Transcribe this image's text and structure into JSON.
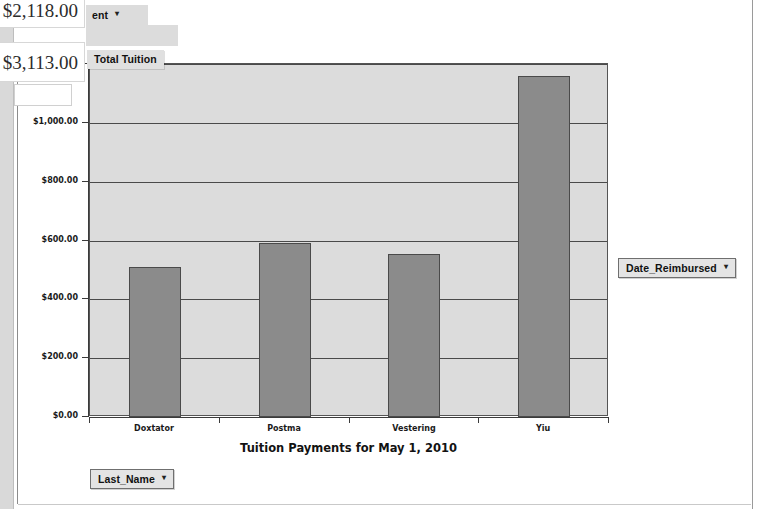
{
  "window": {
    "title": "Tuition Payments for May 1, 2010"
  },
  "datasheet": {
    "cells": [
      {
        "value": "$2,118.00"
      },
      {
        "value": "$3,113.00"
      }
    ]
  },
  "field_buttons": {
    "payment": {
      "label": "ent",
      "caret": "▾"
    },
    "total_tuition": {
      "label": "Total Tuition"
    },
    "date_reimbursed": {
      "label": "Date_Reimbursed",
      "caret": "▾"
    },
    "last_name": {
      "label": "Last_Name",
      "caret": "▾"
    }
  },
  "colors": {
    "bar_fill": "#8b8b8b",
    "bar_stroke": "#4a4a4a",
    "plot_background": "#dcdcdc",
    "gridline": "#4a4a4a",
    "axis": "#3b3b3b",
    "canvas": "#ffffff"
  },
  "chart_data": {
    "type": "bar",
    "title": "Tuition Payments for May 1, 2010",
    "xlabel": "",
    "ylabel": "",
    "categories": [
      "Doxtator",
      "Postma",
      "Vestering",
      "Yiu"
    ],
    "values": [
      510,
      590,
      555,
      1160
    ],
    "value_labels": [
      "$510.00",
      "$590.00",
      "$555.00",
      "$1,160.00"
    ],
    "series": [
      {
        "name": "Total Tuition",
        "values": [
          510,
          590,
          555,
          1160
        ]
      }
    ],
    "ylim": [
      0,
      1200
    ],
    "ytick_values": [
      0,
      200,
      400,
      600,
      800,
      1000,
      1200
    ],
    "ytick_labels": [
      "$0.00",
      "$200.00",
      "$400.00",
      "$600.00",
      "$800.00",
      "$1,000.00",
      "$1,200.00"
    ],
    "grid": true,
    "grid_axis": "y",
    "legend": false,
    "legend_position": "none"
  }
}
